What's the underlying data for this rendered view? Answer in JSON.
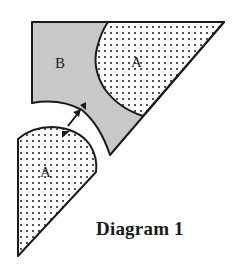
{
  "diagram": {
    "caption": "Diagram 1",
    "regions": [
      {
        "id": "upper-B",
        "label": "B",
        "fill": "#c8c8c8"
      },
      {
        "id": "upper-A",
        "label": "A",
        "fill": "dotted"
      },
      {
        "id": "lower-A",
        "label": "A",
        "fill": "dotted"
      }
    ],
    "arrow": {
      "direction": "up-right"
    },
    "colors": {
      "shaded": "#c8c8c8",
      "outline": "#1a1a1a",
      "dots": "#1a1a1a",
      "background": "#ffffff"
    }
  }
}
